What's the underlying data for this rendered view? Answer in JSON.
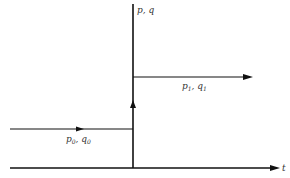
{
  "diagram": {
    "vertical_axis_label": "p, q",
    "horizontal_axis_label": "t",
    "upper_state": {
      "var1": "p",
      "sub1": "1",
      "var2": "q",
      "sub2": "1"
    },
    "lower_state": {
      "var1": "p",
      "sub1": "0",
      "var2": "q",
      "sub2": "0"
    },
    "colors": {
      "line": "#111111",
      "text": "#333333",
      "background": "#ffffff"
    }
  }
}
